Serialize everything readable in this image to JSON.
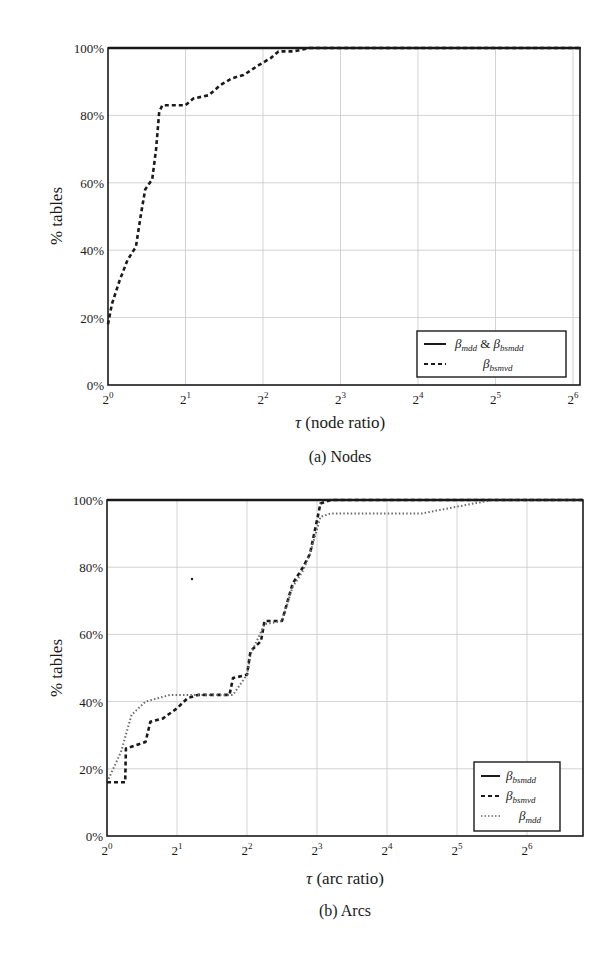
{
  "chart_data": [
    {
      "id": "nodes",
      "type": "line",
      "caption": "(a) Nodes",
      "title": "",
      "xlabel": "τ (node ratio)",
      "ylabel": "% tables",
      "xscale": "log2",
      "x_tick_labels": [
        "2^0",
        "2^1",
        "2^2",
        "2^3",
        "2^4",
        "2^5",
        "2^6"
      ],
      "y_tick_labels": [
        "0%",
        "20%",
        "40%",
        "60%",
        "80%",
        "100%"
      ],
      "xlim_log2": [
        0,
        6.1
      ],
      "ylim": [
        0,
        100
      ],
      "grid": true,
      "legend_position": "lower right",
      "series": [
        {
          "name": "β_mdd & β_bsmdd",
          "style": "solid",
          "x_log2": [
            0,
            6.1
          ],
          "y": [
            100,
            100
          ]
        },
        {
          "name": "β_bsmvd",
          "style": "dashed",
          "x_log2": [
            0,
            0.05,
            0.15,
            0.25,
            0.36,
            0.42,
            0.48,
            0.57,
            0.62,
            0.66,
            0.7,
            0.85,
            1.0,
            1.1,
            1.3,
            1.45,
            1.6,
            1.75,
            1.95,
            2.1,
            2.2,
            2.4,
            2.6,
            6.1
          ],
          "y": [
            18,
            24,
            31,
            37,
            41,
            50,
            58,
            61,
            70,
            81,
            83,
            83,
            83,
            85,
            86,
            89,
            91,
            92,
            95,
            97,
            99,
            99,
            100,
            100
          ]
        }
      ]
    },
    {
      "id": "arcs",
      "type": "line",
      "caption": "(b) Arcs",
      "title": "",
      "xlabel": "τ (arc ratio)",
      "ylabel": "% tables",
      "xscale": "log2",
      "x_tick_labels": [
        "2^0",
        "2^1",
        "2^2",
        "2^3",
        "2^4",
        "2^5",
        "2^6"
      ],
      "y_tick_labels": [
        "0%",
        "20%",
        "40%",
        "60%",
        "80%",
        "100%"
      ],
      "xlim_log2": [
        0,
        6.8
      ],
      "ylim": [
        0,
        100
      ],
      "grid": true,
      "legend_position": "lower right",
      "series": [
        {
          "name": "β_bsmdd",
          "style": "solid",
          "x_log2": [
            0,
            6.8
          ],
          "y": [
            100,
            100
          ]
        },
        {
          "name": "β_bsmvd",
          "style": "dashed",
          "x_log2": [
            0,
            0.26,
            0.27,
            0.55,
            0.62,
            0.8,
            1.0,
            1.15,
            1.3,
            1.75,
            1.8,
            2.0,
            2.05,
            2.2,
            2.25,
            2.5,
            2.65,
            2.8,
            2.9,
            3.05,
            3.2,
            6.8
          ],
          "y": [
            16,
            16,
            26,
            28,
            34,
            35,
            38,
            41,
            42,
            42,
            47,
            48,
            55,
            58,
            64,
            64,
            75,
            80,
            84,
            99,
            100,
            100
          ]
        },
        {
          "name": "β_mdd",
          "style": "dotted",
          "x_log2": [
            0,
            0.2,
            0.35,
            0.55,
            0.9,
            1.8,
            2.0,
            2.05,
            2.25,
            2.5,
            2.65,
            2.8,
            2.9,
            3.05,
            3.2,
            4.5,
            5.0,
            5.5,
            6.8
          ],
          "y": [
            16,
            25,
            36,
            40,
            42,
            42,
            48,
            54,
            63,
            64,
            74,
            79,
            84,
            95,
            96,
            96,
            98,
            100,
            100
          ]
        }
      ]
    }
  ],
  "figures": {
    "nodes": {
      "caption": "(a) Nodes",
      "xlabel": "τ (node ratio)",
      "ylabel": "% tables",
      "legend": [
        {
          "label": "β",
          "sub": "mdd",
          "joiner": " & ",
          "label2": "β",
          "sub2": "bsmdd",
          "style": "solid"
        },
        {
          "label": "β",
          "sub": "bsmvd",
          "style": "dashed"
        }
      ]
    },
    "arcs": {
      "caption": "(b) Arcs",
      "xlabel": "τ (arc ratio)",
      "ylabel": "% tables",
      "legend": [
        {
          "label": "β",
          "sub": "bsmdd",
          "style": "solid"
        },
        {
          "label": "β",
          "sub": "bsmvd",
          "style": "dashed"
        },
        {
          "label": "β",
          "sub": "mdd",
          "style": "dotted"
        }
      ]
    }
  },
  "colors": {
    "line": "#1a1a1a",
    "grid": "#c8c8c8",
    "dotted": "#6a6a6a"
  }
}
